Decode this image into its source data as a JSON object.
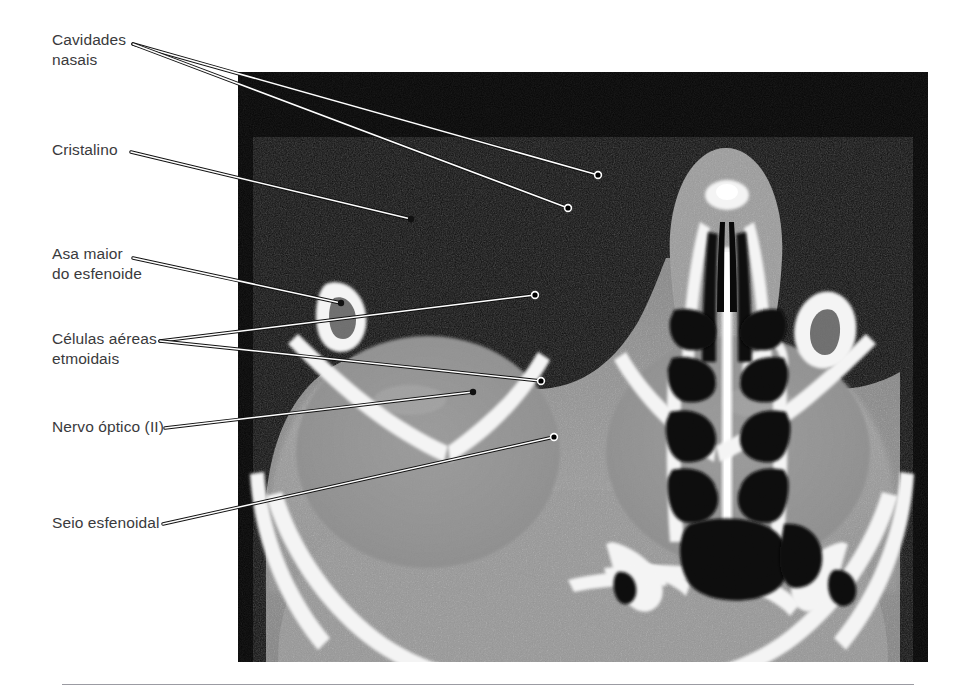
{
  "figure": {
    "type": "annotated-medical-image",
    "modality": "CT",
    "plane": "axial",
    "region": "orbits, nasal cavity and skull base",
    "language": "pt-BR",
    "background_color": "#ffffff",
    "image_panel": {
      "x": 238,
      "y": 72,
      "width": 690,
      "height": 590,
      "background": "#000000"
    },
    "footer_rule": {
      "x": 62,
      "y": 684,
      "width": 852,
      "color": "#9b9ba2"
    }
  },
  "style": {
    "label_color": "#3a3a3c",
    "leader_line_core": "#ffffff",
    "leader_line_outline": "#111111",
    "marker_open_fill": "#000000",
    "marker_open_stroke": "#ffffff",
    "marker_solid_fill": "#111111"
  },
  "labels": [
    {
      "id": "cavidades-nasais",
      "text": "Cavidades\nnasais",
      "x": 52,
      "y": 30,
      "origin": [
        133,
        44
      ],
      "markers": [
        {
          "x": 598,
          "y": 175,
          "style": "open"
        },
        {
          "x": 568,
          "y": 208,
          "style": "open"
        }
      ]
    },
    {
      "id": "cristalino",
      "text": "Cristalino",
      "x": 52,
      "y": 140,
      "origin": [
        131,
        152
      ],
      "markers": [
        {
          "x": 411,
          "y": 219,
          "style": "solid"
        }
      ]
    },
    {
      "id": "asa-maior-do-esfenoide",
      "text": "Asa maior\ndo esfenoide",
      "x": 52,
      "y": 244,
      "origin": [
        133,
        258
      ],
      "markers": [
        {
          "x": 341,
          "y": 303,
          "style": "solid"
        }
      ]
    },
    {
      "id": "celulas-aereas-etmoidais",
      "text": "Células aéreas\netmoidais",
      "x": 52,
      "y": 329,
      "origin": [
        160,
        341
      ],
      "markers": [
        {
          "x": 535,
          "y": 295,
          "style": "open"
        },
        {
          "x": 541,
          "y": 381,
          "style": "open"
        }
      ]
    },
    {
      "id": "nervo-optico-ii",
      "text": "Nervo óptico (II)",
      "x": 52,
      "y": 417,
      "origin": [
        165,
        428
      ],
      "markers": [
        {
          "x": 473,
          "y": 392,
          "style": "solid"
        }
      ]
    },
    {
      "id": "seio-esfenoidal",
      "text": "Seio esfenoidal",
      "x": 52,
      "y": 513,
      "origin": [
        163,
        524
      ],
      "markers": [
        {
          "x": 554,
          "y": 437,
          "style": "open"
        }
      ]
    }
  ]
}
